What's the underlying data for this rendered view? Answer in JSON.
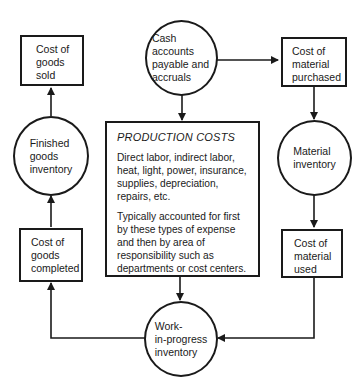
{
  "diagram": {
    "nodes": {
      "cost_goods_sold": {
        "label": "Cost of goods sold",
        "lines": [
          "Cost of",
          "goods",
          "sold"
        ],
        "shape": "box"
      },
      "finished_goods": {
        "label": "Finished goods inventory",
        "lines": [
          "Finished",
          "goods",
          "inventory"
        ],
        "shape": "circle"
      },
      "cost_goods_completed": {
        "label": "Cost of goods completed",
        "lines": [
          "Cost of",
          "goods",
          "completed"
        ],
        "shape": "box"
      },
      "cash_accounts": {
        "label": "Cash accounts payable and accruals",
        "lines": [
          "Cash",
          "accounts",
          "payable and",
          "accruals"
        ],
        "shape": "circle"
      },
      "production_costs": {
        "title": "PRODUCTION COSTS",
        "paragraph1": "Direct labor, indirect labor, heat, light, power, insurance, supplies, depreciation, repairs, etc.",
        "paragraph2": "Typically accounted for first by these types of expense and then by area of responsibility such as departments or cost centers.",
        "shape": "box"
      },
      "work_in_progress": {
        "label": "Work-in-progress inventory",
        "lines": [
          "Work-",
          "in-progress",
          "inventory"
        ],
        "shape": "circle"
      },
      "cost_material_purchased": {
        "label": "Cost of material purchased",
        "lines": [
          "Cost of",
          "material",
          "purchased"
        ],
        "shape": "box"
      },
      "material_inventory": {
        "label": "Material inventory",
        "lines": [
          "Material",
          "inventory"
        ],
        "shape": "circle"
      },
      "cost_material_used": {
        "label": "Cost of material used",
        "lines": [
          "Cost of",
          "material",
          "used"
        ],
        "shape": "box"
      }
    },
    "edges": [
      {
        "from": "Cash accounts payable and accruals",
        "to": "Cost of material purchased"
      },
      {
        "from": "Cash accounts payable and accruals",
        "to": "PRODUCTION COSTS"
      },
      {
        "from": "Cost of material purchased",
        "to": "Material inventory"
      },
      {
        "from": "Material inventory",
        "to": "Cost of material used"
      },
      {
        "from": "Cost of material used",
        "to": "Work-in-progress inventory"
      },
      {
        "from": "PRODUCTION COSTS",
        "to": "Work-in-progress inventory"
      },
      {
        "from": "Work-in-progress inventory",
        "to": "Cost of goods completed"
      },
      {
        "from": "Cost of goods completed",
        "to": "Finished goods inventory"
      },
      {
        "from": "Finished goods inventory",
        "to": "Cost of goods sold"
      }
    ],
    "colors": {
      "line": "#1a1a1a",
      "background": "#ffffff"
    }
  }
}
